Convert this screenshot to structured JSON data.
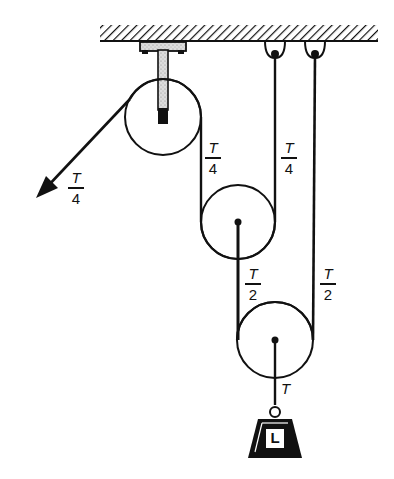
{
  "diagram": {
    "type": "compound pulley system",
    "colors": {
      "ink": "#111111",
      "background": "#ffffff",
      "bracket_fill": "#d9d9d9"
    },
    "elements": {
      "ceiling": {
        "label": "ceiling"
      },
      "fixed_pulley": {
        "label": "fixed pulley"
      },
      "middle_pulley": {
        "label": "movable pulley 1"
      },
      "lower_pulley": {
        "label": "movable pulley 2"
      },
      "load": {
        "label": "L"
      }
    },
    "labels": {
      "pull": {
        "num": "T",
        "den": "4"
      },
      "rope_fixed_to_middle": {
        "num": "T",
        "den": "4"
      },
      "rope_middle_to_hook": {
        "num": "T",
        "den": "4"
      },
      "rope_middle_to_lower": {
        "num": "T",
        "den": "2"
      },
      "rope_lower_to_hook": {
        "num": "T",
        "den": "2"
      },
      "load_rope": "T"
    }
  }
}
